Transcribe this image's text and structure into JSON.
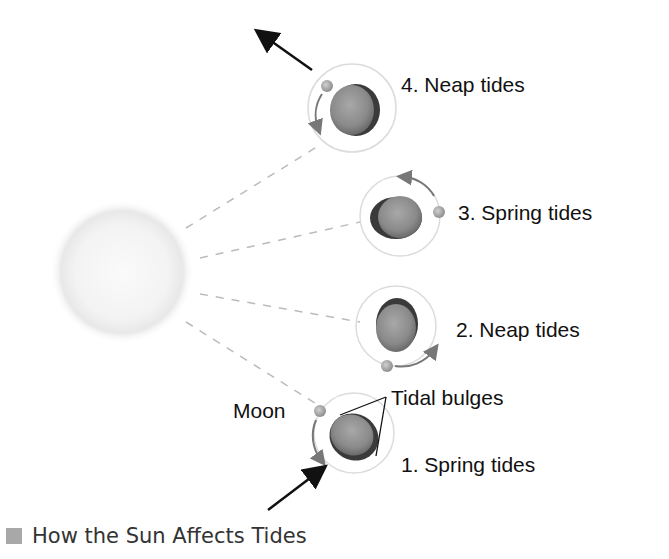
{
  "figure": {
    "caption": "How the Sun Affects Tides",
    "labels": {
      "neap4": "4. Neap tides",
      "spring3": "3. Spring tides",
      "neap2": "2. Neap tides",
      "spring1": "1. Spring tides",
      "moon": "Moon",
      "tidal_bulges": "Tidal bulges"
    },
    "colors": {
      "earth": "#8a8a8a",
      "earth_shadow": "#3a3a3a",
      "orbit": "#d8d8d8",
      "moon": "#b0b0b0",
      "sun": "#eeeeee",
      "dash": "#bbbbbb",
      "arrow": "#111111",
      "orbit_arrow": "#777777"
    }
  }
}
